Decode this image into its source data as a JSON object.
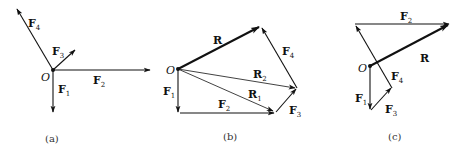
{
  "figure": {
    "color": "#111111",
    "panels": [
      {
        "id": "a",
        "caption": "(a)",
        "origin_label": "O",
        "vectors": [
          {
            "name": "F",
            "sub": "1"
          },
          {
            "name": "F",
            "sub": "2"
          },
          {
            "name": "F",
            "sub": "3"
          },
          {
            "name": "F",
            "sub": "4"
          }
        ]
      },
      {
        "id": "b",
        "caption": "(b)",
        "origin_label": "O",
        "vectors": [
          {
            "name": "F",
            "sub": "1"
          },
          {
            "name": "F",
            "sub": "2"
          },
          {
            "name": "F",
            "sub": "3"
          },
          {
            "name": "F",
            "sub": "4"
          },
          {
            "name": "R",
            "sub": "1"
          },
          {
            "name": "R",
            "sub": "2"
          },
          {
            "name": "R",
            "sub": ""
          }
        ]
      },
      {
        "id": "c",
        "caption": "(c)",
        "origin_label": "O",
        "vectors": [
          {
            "name": "F",
            "sub": "1"
          },
          {
            "name": "F",
            "sub": "3"
          },
          {
            "name": "F",
            "sub": "4"
          },
          {
            "name": "F",
            "sub": "2"
          },
          {
            "name": "R",
            "sub": ""
          }
        ]
      }
    ]
  }
}
